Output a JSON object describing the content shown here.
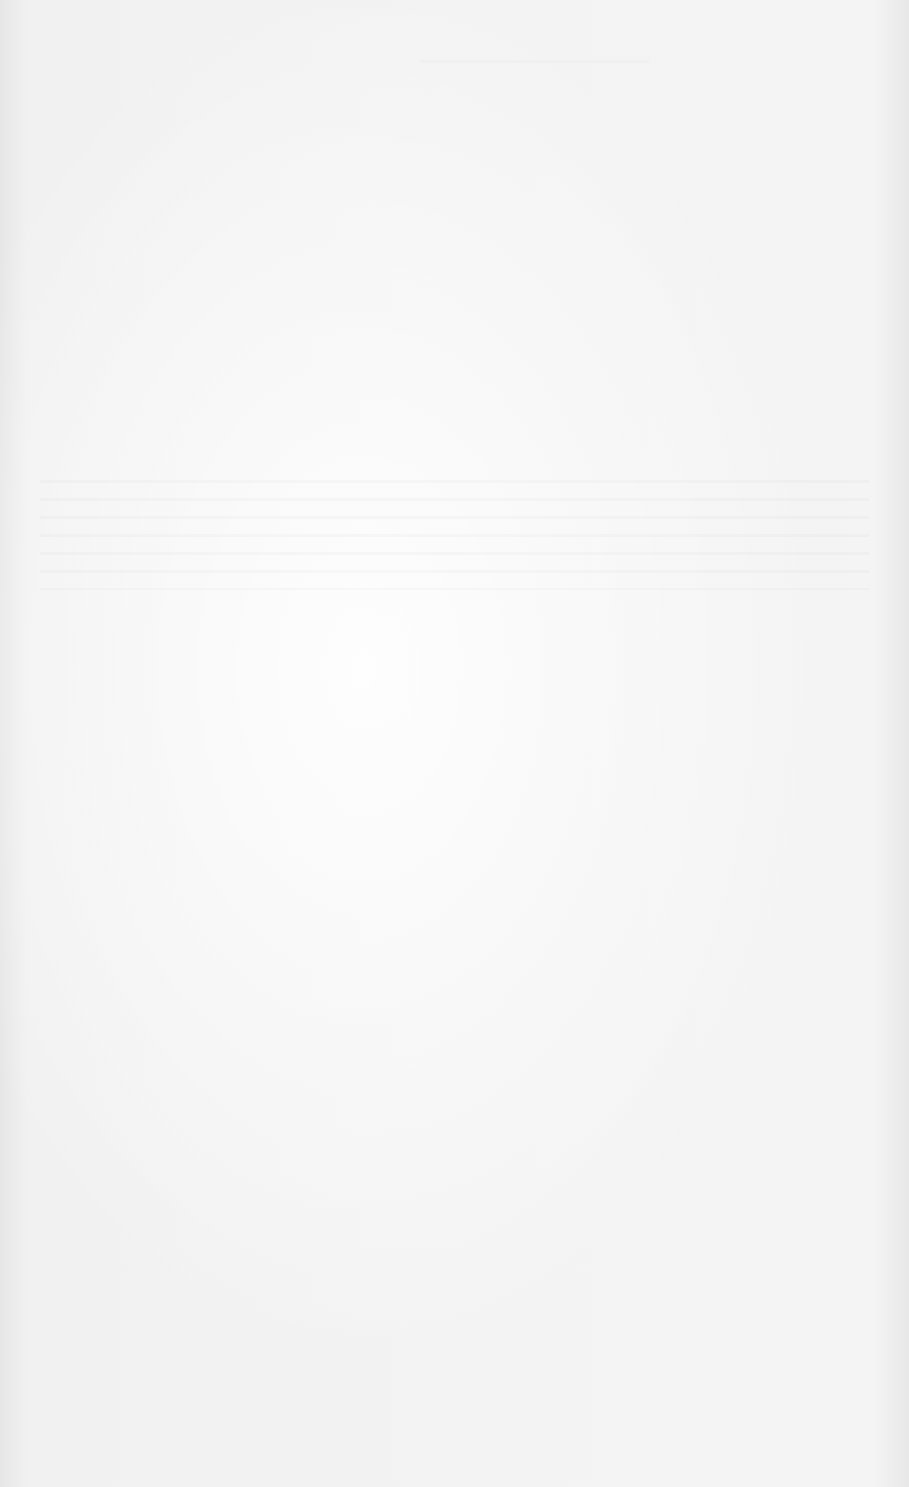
{
  "page": {
    "type": "scanned blank page",
    "background_color": "#f2f2f2",
    "visible_text": ""
  }
}
